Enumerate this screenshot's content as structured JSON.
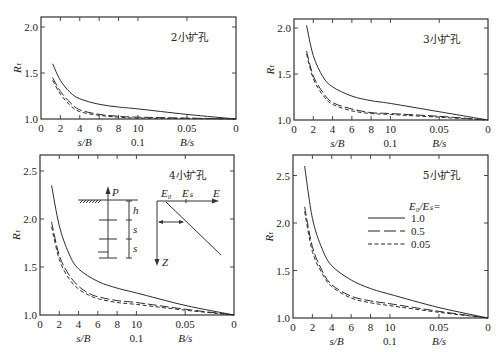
{
  "figure": {
    "legend": {
      "title": "E₀/Eₛ=",
      "entries": [
        {
          "label": "1.0",
          "style": "solid"
        },
        {
          "label": "0.5",
          "style": "long-dash"
        },
        {
          "label": "0.05",
          "style": "short-dash"
        }
      ]
    },
    "inset": {
      "pile_labels": {
        "load": "P",
        "h": "h",
        "s1": "s",
        "s2": "s"
      },
      "modulus_labels": {
        "E0": "E₀",
        "Es": "Eₛ",
        "E": "E",
        "Z": "Z"
      }
    }
  },
  "chart_data": [
    {
      "type": "line",
      "title": "2小扩孔",
      "ylabel": "Rₜ",
      "xlabel_left": "s/B",
      "xlabel_mid": "0.1",
      "xlabel_right": "B/s",
      "x_ticks": [
        "0",
        "2",
        "4",
        "6",
        "8",
        "10",
        "0.05",
        "0"
      ],
      "y_ticks": [
        "1.0",
        "1.5",
        "2.0"
      ],
      "ylim": [
        1.0,
        2.05
      ],
      "frame": {
        "x0": 41,
        "x1": 236,
        "y_top": 17,
        "y_bottom": 119,
        "y_at_1": 119,
        "px_per_unit": 92
      },
      "series": [
        {
          "name": "1.0",
          "style": "solid",
          "points": [
            [
              1.2,
              1.6
            ],
            [
              2,
              1.42
            ],
            [
              3,
              1.29
            ],
            [
              4,
              1.22
            ],
            [
              6,
              1.16
            ],
            [
              8,
              1.13
            ],
            [
              10,
              1.11
            ],
            [
              0.05,
              1.05
            ],
            [
              0,
              1.0
            ]
          ]
        },
        {
          "name": "0.5",
          "style": "long-dash",
          "points": [
            [
              1.2,
              1.45
            ],
            [
              2,
              1.3
            ],
            [
              3,
              1.18
            ],
            [
              4,
              1.1
            ],
            [
              6,
              1.05
            ],
            [
              8,
              1.03
            ],
            [
              10,
              1.02
            ],
            [
              0.05,
              1.01
            ],
            [
              0,
              1.0
            ]
          ]
        },
        {
          "name": "0.05",
          "style": "short-dash",
          "points": [
            [
              1.2,
              1.42
            ],
            [
              2,
              1.27
            ],
            [
              3,
              1.15
            ],
            [
              4,
              1.08
            ],
            [
              6,
              1.04
            ],
            [
              8,
              1.02
            ],
            [
              10,
              1.01
            ],
            [
              0.05,
              1.005
            ],
            [
              0,
              1.0
            ]
          ]
        }
      ]
    },
    {
      "type": "line",
      "title": "3小扩孔",
      "ylabel": "Rₜ",
      "xlabel_left": "s/B",
      "xlabel_mid": "0.1",
      "xlabel_right": "B/s",
      "x_ticks": [
        "0",
        "2",
        "4",
        "6",
        "8",
        "10",
        "0.05",
        "0"
      ],
      "y_ticks": [
        "1.0",
        "1.5",
        "2.0"
      ],
      "ylim": [
        1.0,
        2.1
      ],
      "frame": {
        "x0": 294,
        "x1": 488,
        "y_top": 19,
        "y_bottom": 120,
        "y_at_1": 120,
        "px_per_unit": 92
      },
      "series": [
        {
          "name": "1.0",
          "style": "solid",
          "points": [
            [
              1.3,
              2.03
            ],
            [
              2,
              1.7
            ],
            [
              3,
              1.47
            ],
            [
              4,
              1.36
            ],
            [
              6,
              1.26
            ],
            [
              8,
              1.21
            ],
            [
              10,
              1.18
            ],
            [
              0.05,
              1.09
            ],
            [
              0,
              1.0
            ]
          ]
        },
        {
          "name": "0.5",
          "style": "long-dash",
          "points": [
            [
              1.3,
              1.75
            ],
            [
              2,
              1.48
            ],
            [
              3,
              1.3
            ],
            [
              4,
              1.19
            ],
            [
              6,
              1.12
            ],
            [
              8,
              1.08
            ],
            [
              10,
              1.07
            ],
            [
              0.05,
              1.04
            ],
            [
              0,
              1.0
            ]
          ]
        },
        {
          "name": "0.05",
          "style": "short-dash",
          "points": [
            [
              1.3,
              1.72
            ],
            [
              2,
              1.45
            ],
            [
              3,
              1.27
            ],
            [
              4,
              1.17
            ],
            [
              6,
              1.1
            ],
            [
              8,
              1.07
            ],
            [
              10,
              1.06
            ],
            [
              0.05,
              1.03
            ],
            [
              0,
              1.0
            ]
          ]
        }
      ]
    },
    {
      "type": "line",
      "title": "4小扩孔",
      "ylabel": "Rₜ",
      "xlabel_left": "s/B",
      "xlabel_mid": "0.1",
      "xlabel_right": "B/s",
      "x_ticks": [
        "0",
        "2",
        "4",
        "6",
        "8",
        "10",
        "0.05",
        "0"
      ],
      "y_ticks": [
        "1.0",
        "1.5",
        "2.0",
        "2.5"
      ],
      "ylim": [
        1.0,
        2.65
      ],
      "frame": {
        "x0": 40,
        "x1": 234,
        "y_top": 155,
        "y_bottom": 315,
        "y_at_1": 315,
        "px_per_unit": 96
      },
      "series": [
        {
          "name": "1.0",
          "style": "solid",
          "points": [
            [
              1.2,
              2.35
            ],
            [
              2,
              1.93
            ],
            [
              3,
              1.64
            ],
            [
              4,
              1.48
            ],
            [
              6,
              1.35
            ],
            [
              8,
              1.28
            ],
            [
              10,
              1.23
            ],
            [
              0.05,
              1.1
            ],
            [
              0,
              1.0
            ]
          ]
        },
        {
          "name": "0.5",
          "style": "long-dash",
          "points": [
            [
              1.2,
              1.97
            ],
            [
              2,
              1.62
            ],
            [
              3,
              1.42
            ],
            [
              4,
              1.3
            ],
            [
              5,
              1.23
            ],
            [
              6,
              1.19
            ],
            [
              8,
              1.15
            ],
            [
              10,
              1.13
            ],
            [
              0.05,
              1.06
            ],
            [
              0,
              1.0
            ]
          ]
        },
        {
          "name": "0.05",
          "style": "short-dash",
          "points": [
            [
              1.2,
              1.92
            ],
            [
              2,
              1.58
            ],
            [
              3,
              1.38
            ],
            [
              4,
              1.27
            ],
            [
              5,
              1.21
            ],
            [
              6,
              1.17
            ],
            [
              8,
              1.13
            ],
            [
              10,
              1.11
            ],
            [
              0.05,
              1.05
            ],
            [
              0,
              1.0
            ]
          ]
        }
      ]
    },
    {
      "type": "line",
      "title": "5小扩孔",
      "ylabel": "Rₜ",
      "xlabel_left": "s/B",
      "xlabel_mid": "0.1",
      "xlabel_right": "B/s",
      "x_ticks": [
        "0",
        "2",
        "4",
        "6",
        "8",
        "10",
        "0.05",
        "0"
      ],
      "y_ticks": [
        "1.0",
        "1.5",
        "2.0",
        "2.5"
      ],
      "ylim": [
        1.0,
        2.7
      ],
      "frame": {
        "x0": 293,
        "x1": 488,
        "y_top": 155,
        "y_bottom": 318,
        "y_at_1": 318,
        "px_per_unit": 95
      },
      "series": [
        {
          "name": "1.0",
          "style": "solid",
          "points": [
            [
              1.2,
              2.6
            ],
            [
              2,
              2.05
            ],
            [
              3,
              1.73
            ],
            [
              4,
              1.55
            ],
            [
              6,
              1.4
            ],
            [
              8,
              1.31
            ],
            [
              10,
              1.25
            ],
            [
              0.05,
              1.11
            ],
            [
              0,
              1.0
            ]
          ]
        },
        {
          "name": "0.5",
          "style": "long-dash",
          "points": [
            [
              1.2,
              2.17
            ],
            [
              2,
              1.75
            ],
            [
              3,
              1.5
            ],
            [
              4,
              1.35
            ],
            [
              6,
              1.23
            ],
            [
              8,
              1.18
            ],
            [
              10,
              1.15
            ],
            [
              0.05,
              1.07
            ],
            [
              0,
              1.0
            ]
          ]
        },
        {
          "name": "0.05",
          "style": "short-dash",
          "points": [
            [
              1.2,
              2.12
            ],
            [
              2,
              1.7
            ],
            [
              3,
              1.47
            ],
            [
              4,
              1.33
            ],
            [
              6,
              1.21
            ],
            [
              8,
              1.16
            ],
            [
              10,
              1.13
            ],
            [
              0.05,
              1.06
            ],
            [
              0,
              1.0
            ]
          ]
        }
      ]
    }
  ]
}
